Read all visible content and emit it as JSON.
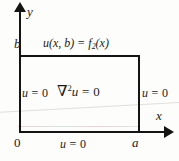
{
  "figure": {
    "background_color": "#fdfdfc",
    "line_color": "#141414"
  },
  "axes": {
    "y_axis_label": "y",
    "x_axis_label": "x",
    "origin_label": "0",
    "x_max_tick_label": "a",
    "y_max_tick_label": "b"
  },
  "domain": {
    "pde_symbol": "∇",
    "pde_exponent": "2",
    "pde_variable": "u",
    "pde_equals": " = 0",
    "pde_full": "∇²u = 0"
  },
  "boundary_conditions": {
    "top": {
      "lhs": "u(x, b)",
      "equals": " = ",
      "rhs_function": "f",
      "rhs_subscript": "2",
      "rhs_argument": "(x)",
      "full": "u(x, b) = f₂(x)"
    },
    "left": {
      "variable": "u",
      "equals": " = 0",
      "full": "u = 0"
    },
    "right": {
      "variable": "u",
      "equals": " = 0",
      "full": "u = 0"
    },
    "bottom": {
      "variable": "u",
      "equals": " = 0",
      "full": "u = 0"
    }
  }
}
